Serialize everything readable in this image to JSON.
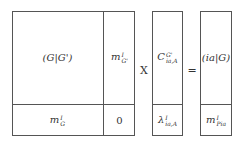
{
  "matrix_A": {
    "top_left": "(G|G')",
    "top_right": {
      "base": "m",
      "sup": "I",
      "sub": "G'"
    },
    "bottom_left": {
      "base": "m",
      "sup": "I",
      "sub": "G"
    },
    "bottom_right": "0"
  },
  "operator_multiply": "X",
  "vector_x": {
    "top": {
      "base": "C",
      "sup": "G'",
      "sub": "ia,A"
    },
    "bottom": {
      "base": "λ",
      "sup": "I",
      "sub": "ia,A"
    }
  },
  "operator_equals": "=",
  "vector_b": {
    "top": "(ia|G)",
    "bottom": {
      "base": "m",
      "sup": "I",
      "sub": "Pia"
    }
  },
  "colors": {
    "border": "#555555",
    "text": "#333333",
    "background": "#ffffff"
  }
}
